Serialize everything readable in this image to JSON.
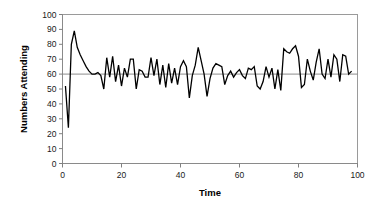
{
  "chart_data": {
    "type": "line",
    "title": "",
    "subtitle": "",
    "xlabel": "Time",
    "ylabel": "Numbers Attending",
    "xlim": [
      0,
      100
    ],
    "ylim": [
      0,
      100
    ],
    "xticks": [
      0,
      20,
      40,
      60,
      80,
      100
    ],
    "yticks": [
      0,
      10,
      20,
      30,
      40,
      50,
      60,
      70,
      80,
      90,
      100
    ],
    "grid": false,
    "legend": "none",
    "reference_lines": [
      {
        "axis": "y",
        "value": 60,
        "color": "#808080",
        "label": ""
      }
    ],
    "series": [
      {
        "name": "Numbers Attending",
        "color": "#000000",
        "line_width": 1.3,
        "x": [
          1,
          2,
          3,
          4,
          5,
          6,
          7,
          8,
          9,
          10,
          11,
          12,
          13,
          14,
          15,
          16,
          17,
          18,
          19,
          20,
          21,
          22,
          23,
          24,
          25,
          26,
          27,
          28,
          29,
          30,
          31,
          32,
          33,
          34,
          35,
          36,
          37,
          38,
          39,
          40,
          41,
          42,
          43,
          44,
          45,
          46,
          47,
          48,
          49,
          50,
          51,
          52,
          53,
          54,
          55,
          56,
          57,
          58,
          59,
          60,
          61,
          62,
          63,
          64,
          65,
          66,
          67,
          68,
          69,
          70,
          71,
          72,
          73,
          74,
          75,
          76,
          77,
          78,
          79,
          80,
          81,
          82,
          83,
          84,
          85,
          86,
          87,
          88,
          89,
          90,
          91,
          92,
          93,
          94,
          95,
          96,
          97,
          98
        ],
        "values": [
          52,
          24,
          80,
          89,
          78,
          73,
          69,
          65,
          62,
          60,
          60,
          61,
          59,
          50,
          71,
          58,
          72,
          55,
          66,
          52,
          64,
          58,
          70,
          70,
          50,
          63,
          62,
          58,
          58,
          71,
          59,
          70,
          53,
          66,
          51,
          67,
          54,
          64,
          53,
          65,
          69,
          65,
          44,
          59,
          66,
          78,
          69,
          60,
          45,
          57,
          64,
          67,
          66,
          65,
          53,
          59,
          62,
          58,
          61,
          63,
          59,
          57,
          64,
          63,
          65,
          52,
          50,
          55,
          65,
          58,
          64,
          50,
          63,
          49,
          77,
          75,
          74,
          77,
          79,
          72,
          51,
          53,
          70,
          62,
          56,
          68,
          77,
          60,
          57,
          70,
          58,
          73,
          70,
          55,
          73,
          72,
          60,
          62
        ],
        "min": 24,
        "max": 89,
        "mean": 62
      }
    ],
    "axis_color": "#808080",
    "tick_label_color": "#1a1a1a",
    "background": "#ffffff"
  },
  "axes": {
    "y_title": "Numbers Attending",
    "x_title": "Time",
    "y_tick_labels": [
      "0",
      "10",
      "20",
      "30",
      "40",
      "50",
      "60",
      "70",
      "80",
      "90",
      "100"
    ],
    "x_tick_labels": [
      "0",
      "20",
      "40",
      "60",
      "80",
      "100"
    ]
  }
}
